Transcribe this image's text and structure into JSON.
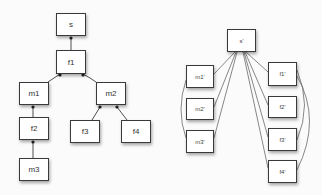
{
  "left_tree": {
    "nodes": [
      {
        "id": "s",
        "label": "s",
        "x": 56,
        "y": 13,
        "w": 30,
        "h": 23
      },
      {
        "id": "f1",
        "label": "f1",
        "x": 56,
        "y": 50,
        "w": 30,
        "h": 24
      },
      {
        "id": "m1",
        "label": "m1",
        "x": 19,
        "y": 82,
        "w": 30,
        "h": 23
      },
      {
        "id": "m2",
        "label": "m2",
        "x": 96,
        "y": 82,
        "w": 30,
        "h": 23
      },
      {
        "id": "f2",
        "label": "f2",
        "x": 19,
        "y": 117,
        "w": 30,
        "h": 23
      },
      {
        "id": "f3",
        "label": "f3",
        "x": 70,
        "y": 120,
        "w": 30,
        "h": 23
      },
      {
        "id": "f4",
        "label": "f4",
        "x": 121,
        "y": 120,
        "w": 30,
        "h": 23
      },
      {
        "id": "m3",
        "label": "m3",
        "x": 19,
        "y": 158,
        "w": 30,
        "h": 23
      }
    ],
    "edges": [
      {
        "from": "s",
        "to": "f1"
      },
      {
        "from": "f1",
        "to": "m1"
      },
      {
        "from": "f1",
        "to": "m2"
      },
      {
        "from": "m1",
        "to": "f2"
      },
      {
        "from": "f2",
        "to": "m3"
      },
      {
        "from": "m2",
        "to": "f3"
      },
      {
        "from": "m2",
        "to": "f4"
      }
    ]
  },
  "right_graph": {
    "nodes": [
      {
        "id": "s'",
        "label": "s'",
        "x": 227,
        "y": 29,
        "w": 29,
        "h": 23
      },
      {
        "id": "m1'",
        "label": "m1'",
        "x": 186,
        "y": 65,
        "w": 28,
        "h": 23
      },
      {
        "id": "m2'",
        "label": "m2'",
        "x": 186,
        "y": 98,
        "w": 28,
        "h": 22
      },
      {
        "id": "m3'",
        "label": "m3'",
        "x": 186,
        "y": 130,
        "w": 28,
        "h": 23
      },
      {
        "id": "f1'",
        "label": "f1'",
        "x": 268,
        "y": 62,
        "w": 29,
        "h": 24
      },
      {
        "id": "f2'",
        "label": "f2'",
        "x": 268,
        "y": 96,
        "w": 29,
        "h": 22
      },
      {
        "id": "f3'",
        "label": "f3'",
        "x": 268,
        "y": 128,
        "w": 29,
        "h": 23
      },
      {
        "id": "f4'",
        "label": "f4'",
        "x": 268,
        "y": 160,
        "w": 29,
        "h": 23
      }
    ],
    "edges": [
      {
        "from": "s'",
        "to": "m1'"
      },
      {
        "from": "s'",
        "to": "m2'"
      },
      {
        "from": "s'",
        "to": "m3'"
      },
      {
        "from": "s'",
        "to": "f1'"
      },
      {
        "from": "s'",
        "to": "f2'"
      },
      {
        "from": "s'",
        "to": "f3'"
      },
      {
        "from": "s'",
        "to": "f4'"
      },
      {
        "from": "m1'",
        "to": "m3'",
        "curved": true
      },
      {
        "from": "f1'",
        "to": "f3'",
        "curved": true
      },
      {
        "from": "f1'",
        "to": "f4'",
        "curved": true
      }
    ]
  },
  "colors": {
    "background": "#fbfbfb",
    "node_fill": "#ffffff",
    "node_border": "#3a3a3a",
    "edge": "#3a3a3a"
  }
}
